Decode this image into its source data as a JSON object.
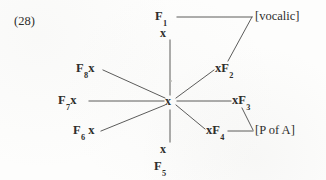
{
  "figure": {
    "example_number": "(28)",
    "type": "feature-geometry-diagram"
  },
  "diagram": {
    "hub": {
      "label": "x",
      "name": "central-node"
    },
    "nodes": [
      {
        "id": "f1",
        "feature": "F",
        "index": "1",
        "text": "F1",
        "order": "feature-first",
        "position": "top"
      },
      {
        "id": "x-top",
        "feature": "",
        "index": "",
        "text": "x",
        "order": "x-only",
        "position": "top-inner"
      },
      {
        "id": "xf2",
        "feature": "F",
        "index": "2",
        "text": "xF2",
        "order": "x-first",
        "position": "upper-right"
      },
      {
        "id": "xf3",
        "feature": "F",
        "index": "3",
        "text": "xF3",
        "order": "x-first",
        "position": "right"
      },
      {
        "id": "xf4",
        "feature": "F",
        "index": "4",
        "text": "xF4",
        "order": "x-first",
        "position": "lower-right"
      },
      {
        "id": "x-bot",
        "feature": "",
        "index": "",
        "text": "x",
        "order": "x-only",
        "position": "bottom-inner"
      },
      {
        "id": "f5",
        "feature": "F",
        "index": "5",
        "text": "F5",
        "order": "feature-first",
        "position": "bottom"
      },
      {
        "id": "f6x",
        "feature": "F",
        "index": "6",
        "text": "F6 x",
        "order": "feature-first",
        "position": "lower-left"
      },
      {
        "id": "f7x",
        "feature": "F",
        "index": "7",
        "text": "F7x",
        "order": "feature-first",
        "position": "left"
      },
      {
        "id": "f8x",
        "feature": "F",
        "index": "8",
        "text": "F8x",
        "order": "feature-first",
        "position": "upper-left"
      }
    ],
    "bracket_labels": [
      {
        "id": "vocalic",
        "text": "[vocalic]",
        "connects": [
          "F1",
          "xF2"
        ]
      },
      {
        "id": "poa",
        "text": "[P of A]",
        "connects": [
          "xF3",
          "xF4"
        ]
      }
    ],
    "colors": {
      "ink": "#2e2e2c",
      "line": "#4a4a48",
      "background": "#fdfdfc"
    }
  }
}
